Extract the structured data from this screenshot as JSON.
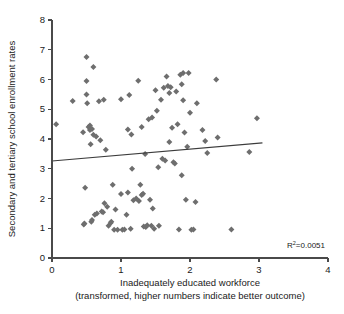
{
  "chart_data": {
    "type": "scatter",
    "title": "",
    "xlabel": "Inadequately educated workforce",
    "xlabel_sub": "(transformed, higher numbers indicate better outcome)",
    "ylabel": "Secondary and tertiary school enrollment rates",
    "xlim": [
      0,
      4
    ],
    "ylim": [
      0,
      8
    ],
    "xticks": [
      0,
      1,
      2,
      3,
      4
    ],
    "yticks": [
      0,
      1,
      2,
      3,
      4,
      5,
      6,
      7,
      8
    ],
    "xtick_labels": [
      "0",
      "1",
      "2",
      "3",
      "4"
    ],
    "ytick_labels": [
      "0",
      "1",
      "2",
      "3",
      "4",
      "5",
      "6",
      "7",
      "8"
    ],
    "grid": false,
    "legend": "none",
    "marker_shape": "diamond",
    "marker_color": "#6e6e6e",
    "annotations": [
      {
        "name": "r-squared",
        "text_prefix": "R",
        "text_sup": "2",
        "text_suffix": "=0.0051",
        "full_text": "R2=0.0051",
        "value": 0.0051,
        "x": 2.95,
        "y": 0.45
      }
    ],
    "trend_line": {
      "name": "linear-fit",
      "x_start": 0.0,
      "y_start": 3.26,
      "x_end": 3.05,
      "y_end": 3.87,
      "color": "#3c3c3c"
    },
    "points": [
      [
        0.06,
        4.5
      ],
      [
        0.3,
        5.28
      ],
      [
        0.45,
        4.23
      ],
      [
        0.46,
        1.13
      ],
      [
        0.47,
        1.16
      ],
      [
        0.48,
        2.36
      ],
      [
        0.5,
        6.76
      ],
      [
        0.5,
        5.95
      ],
      [
        0.5,
        5.5
      ],
      [
        0.51,
        5.2
      ],
      [
        0.53,
        4.4
      ],
      [
        0.55,
        4.45
      ],
      [
        0.55,
        4.3
      ],
      [
        0.56,
        3.82
      ],
      [
        0.57,
        1.22
      ],
      [
        0.58,
        4.34
      ],
      [
        0.58,
        1.28
      ],
      [
        0.6,
        6.42
      ],
      [
        0.6,
        4.14
      ],
      [
        0.62,
        1.45
      ],
      [
        0.64,
        4.08
      ],
      [
        0.65,
        1.5
      ],
      [
        0.68,
        5.27
      ],
      [
        0.7,
        3.96
      ],
      [
        0.72,
        1.56
      ],
      [
        0.74,
        1.54
      ],
      [
        0.75,
        5.32
      ],
      [
        0.76,
        1.84
      ],
      [
        0.78,
        3.64
      ],
      [
        0.8,
        1.72
      ],
      [
        0.82,
        1.08
      ],
      [
        0.85,
        1.18
      ],
      [
        0.86,
        1.22
      ],
      [
        0.88,
        2.46
      ],
      [
        0.9,
        0.95
      ],
      [
        0.92,
        1.63
      ],
      [
        0.95,
        0.95
      ],
      [
        1.0,
        5.34
      ],
      [
        1.0,
        2.15
      ],
      [
        1.02,
        0.95
      ],
      [
        1.05,
        0.96
      ],
      [
        1.08,
        1.45
      ],
      [
        1.1,
        4.32
      ],
      [
        1.1,
        2.2
      ],
      [
        1.12,
        5.48
      ],
      [
        1.14,
        0.98
      ],
      [
        1.15,
        4.15
      ],
      [
        1.16,
        3.0
      ],
      [
        1.18,
        1.94
      ],
      [
        1.22,
        2.0
      ],
      [
        1.25,
        5.96
      ],
      [
        1.26,
        1.92
      ],
      [
        1.28,
        2.46
      ],
      [
        1.3,
        4.4
      ],
      [
        1.3,
        2.12
      ],
      [
        1.32,
        2.16
      ],
      [
        1.33,
        1.06
      ],
      [
        1.35,
        3.5
      ],
      [
        1.36,
        1.04
      ],
      [
        1.38,
        1.1
      ],
      [
        1.4,
        4.66
      ],
      [
        1.42,
        1.96
      ],
      [
        1.44,
        1.08
      ],
      [
        1.45,
        4.72
      ],
      [
        1.46,
        1.66
      ],
      [
        1.48,
        0.98
      ],
      [
        1.5,
        5.64
      ],
      [
        1.52,
        4.95
      ],
      [
        1.54,
        3.05
      ],
      [
        1.55,
        1.08
      ],
      [
        1.58,
        5.32
      ],
      [
        1.6,
        3.34
      ],
      [
        1.62,
        5.72
      ],
      [
        1.64,
        3.28
      ],
      [
        1.66,
        6.1
      ],
      [
        1.68,
        5.78
      ],
      [
        1.7,
        3.9
      ],
      [
        1.7,
        5.55
      ],
      [
        1.72,
        5.74
      ],
      [
        1.74,
        4.38
      ],
      [
        1.76,
        3.22
      ],
      [
        1.78,
        3.18
      ],
      [
        1.8,
        5.6
      ],
      [
        1.82,
        4.5
      ],
      [
        1.84,
        0.96
      ],
      [
        1.86,
        6.16
      ],
      [
        1.88,
        5.84
      ],
      [
        1.88,
        2.78
      ],
      [
        1.9,
        6.22
      ],
      [
        1.9,
        5.3
      ],
      [
        1.92,
        4.22
      ],
      [
        1.94,
        1.96
      ],
      [
        1.96,
        3.74
      ],
      [
        1.98,
        6.22
      ],
      [
        2.0,
        4.88
      ],
      [
        2.02,
        0.95
      ],
      [
        2.05,
        0.96
      ],
      [
        2.08,
        1.88
      ],
      [
        2.1,
        5.2
      ],
      [
        2.18,
        4.3
      ],
      [
        2.22,
        3.93
      ],
      [
        2.25,
        3.53
      ],
      [
        2.38,
        6.0
      ],
      [
        2.4,
        4.05
      ],
      [
        2.6,
        0.96
      ],
      [
        2.86,
        3.56
      ],
      [
        2.97,
        4.7
      ]
    ]
  }
}
